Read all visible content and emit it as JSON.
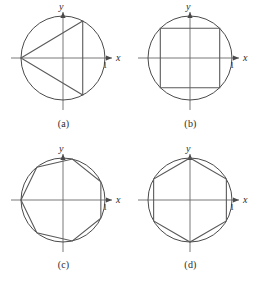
{
  "figure": {
    "background_color": "#ffffff",
    "stroke_color": "#4a4a4a",
    "polygon_color": "#5a5a5a",
    "axis_color": "#6a6a6a",
    "text_color": "#2b2b2b",
    "layout": {
      "columns": 2,
      "rows": 2
    }
  },
  "axis_labels": {
    "x": "x",
    "y": "y",
    "unit_tick": "1"
  },
  "panels": [
    {
      "id": "a",
      "caption": "(a)",
      "shape_name": "inscribed-triangle",
      "sides": 3,
      "circle": {
        "cx": 63,
        "cy": 58,
        "r": 42
      },
      "vertex_angles_deg": [
        180,
        62,
        298
      ],
      "note": "Isosceles triangle with apex at 180 degrees and a vertical right edge"
    },
    {
      "id": "b",
      "caption": "(b)",
      "shape_name": "inscribed-square",
      "sides": 4,
      "circle": {
        "cx": 63,
        "cy": 58,
        "r": 42
      },
      "vertex_angles_deg": [
        45,
        135,
        225,
        315
      ],
      "note": "Axis-aligned square with corners on the circle"
    },
    {
      "id": "c",
      "caption": "(c)",
      "shape_name": "inscribed-heptagon",
      "sides": 7,
      "circle": {
        "cx": 63,
        "cy": 58,
        "r": 42
      },
      "vertex_angles_deg": [
        180,
        128.6,
        77.1,
        25.7,
        334.3,
        282.9,
        231.4
      ],
      "note": "Seven-sided polygon with one vertex on the negative x-axis"
    },
    {
      "id": "d",
      "caption": "(d)",
      "shape_name": "inscribed-hexagon",
      "sides": 6,
      "circle": {
        "cx": 63,
        "cy": 58,
        "r": 42
      },
      "vertex_angles_deg": [
        90,
        30,
        330,
        270,
        210,
        150
      ],
      "note": "Six-sided polygon with vertices at the top and bottom of the y-axis"
    }
  ]
}
